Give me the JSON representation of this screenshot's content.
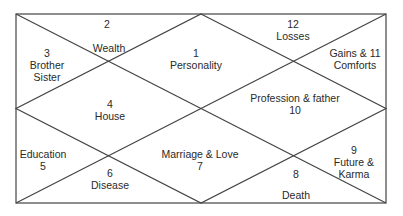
{
  "chart": {
    "frame": {
      "x1": 16,
      "y1": 14,
      "x2": 386,
      "y2": 203,
      "line_color": "#444444"
    },
    "houses": [
      {
        "id": "house-2",
        "lines": [
          "2"
        ],
        "x": 107,
        "y": 18
      },
      {
        "id": "house-2-label",
        "lines": [
          "Wealth"
        ],
        "x": 109,
        "y": 42
      },
      {
        "id": "house-3",
        "lines": [
          "3",
          "Brother",
          "Sister"
        ],
        "x": 47,
        "y": 47
      },
      {
        "id": "house-1",
        "lines": [
          "1",
          "Personality"
        ],
        "x": 196,
        "y": 47
      },
      {
        "id": "house-12",
        "lines": [
          "12",
          "Losses"
        ],
        "x": 293,
        "y": 18
      },
      {
        "id": "house-11",
        "lines": [
          "Gains & 11",
          "Comforts"
        ],
        "x": 355,
        "y": 47
      },
      {
        "id": "house-4",
        "lines": [
          "4",
          "House"
        ],
        "x": 110,
        "y": 98
      },
      {
        "id": "house-10",
        "lines": [
          "Profession & father",
          "10"
        ],
        "x": 295,
        "y": 92
      },
      {
        "id": "house-5",
        "lines": [
          "Education",
          "5"
        ],
        "x": 43,
        "y": 148
      },
      {
        "id": "house-6",
        "lines": [
          "6",
          "Disease"
        ],
        "x": 110,
        "y": 167
      },
      {
        "id": "house-7",
        "lines": [
          "Marriage & Love",
          "7"
        ],
        "x": 200,
        "y": 148
      },
      {
        "id": "house-8",
        "lines": [
          "8"
        ],
        "x": 296,
        "y": 168
      },
      {
        "id": "house-8-label",
        "lines": [
          "Death"
        ],
        "x": 296,
        "y": 189
      },
      {
        "id": "house-9",
        "lines": [
          "9",
          "Future &",
          "Karma"
        ],
        "x": 354,
        "y": 144
      }
    ]
  }
}
